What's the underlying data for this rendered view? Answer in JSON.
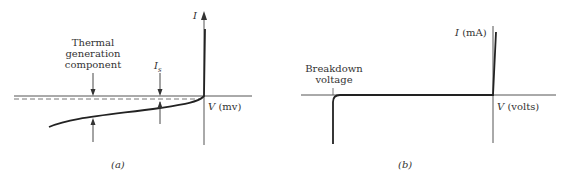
{
  "figure": {
    "panels": [
      {
        "id": "a",
        "caption": "(a)",
        "y_axis_label": "I",
        "x_axis_label_var": "V",
        "x_axis_label_unit": "(mv)",
        "annotations": {
          "thermal_line1": "Thermal",
          "thermal_line2": "generation",
          "thermal_line3": "component",
          "saturation_current": "I",
          "saturation_sub": "s"
        }
      },
      {
        "id": "b",
        "caption": "(b)",
        "y_axis_label_var": "I",
        "y_axis_label_unit": "(mA)",
        "x_axis_label_var": "V",
        "x_axis_label_unit": "(volts)",
        "annotations": {
          "breakdown_line1": "Breakdown",
          "breakdown_line2": "voltage"
        }
      }
    ],
    "colors": {
      "axis": "#555555",
      "curve": "#222222",
      "text": "#333333"
    }
  }
}
